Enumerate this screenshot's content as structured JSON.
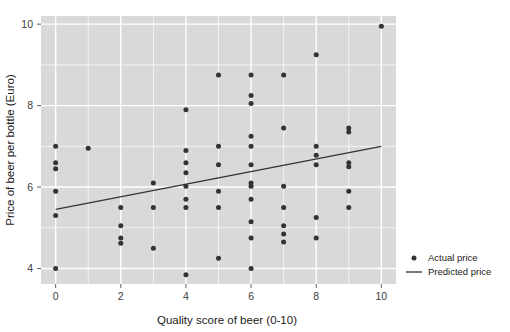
{
  "chart_data": {
    "type": "scatter",
    "title": "",
    "xlabel": "Quality score of beer (0-10)",
    "ylabel": "Price of beer per bottle (Euro)",
    "xlim": [
      -0.45,
      10.45
    ],
    "ylim": [
      3.62,
      10.2
    ],
    "xticks": [
      0,
      2,
      4,
      6,
      8,
      10
    ],
    "xtick_labels": [
      "0",
      "2",
      "4",
      "6",
      "8",
      "10"
    ],
    "yticks": [
      4,
      6,
      8,
      10
    ],
    "ytick_labels": [
      "4",
      "6",
      "8",
      "10"
    ],
    "grid": true,
    "grid_color": "#ffffff",
    "panel_background": "#d9d9d9",
    "point_color": "#333333",
    "line_color": "#333333",
    "legend_position": "right",
    "series": [
      {
        "name": "Actual price",
        "type": "scatter",
        "marker": "circle",
        "points": [
          [
            0,
            7.0
          ],
          [
            0,
            6.6
          ],
          [
            0,
            6.45
          ],
          [
            0,
            5.9
          ],
          [
            0,
            5.3
          ],
          [
            0,
            4.0
          ],
          [
            1,
            6.95
          ],
          [
            2,
            5.5
          ],
          [
            2,
            5.05
          ],
          [
            2,
            4.75
          ],
          [
            2,
            4.62
          ],
          [
            3,
            6.1
          ],
          [
            3,
            5.5
          ],
          [
            3,
            4.5
          ],
          [
            4,
            7.9
          ],
          [
            4,
            6.9
          ],
          [
            4,
            6.6
          ],
          [
            4,
            6.35
          ],
          [
            4,
            6.02
          ],
          [
            4,
            5.7
          ],
          [
            4,
            5.5
          ],
          [
            4,
            3.85
          ],
          [
            5,
            8.75
          ],
          [
            5,
            7.0
          ],
          [
            5,
            6.55
          ],
          [
            5,
            5.9
          ],
          [
            5,
            5.5
          ],
          [
            5,
            4.25
          ],
          [
            6,
            8.75
          ],
          [
            6,
            8.25
          ],
          [
            6,
            8.05
          ],
          [
            6,
            7.25
          ],
          [
            6,
            7.0
          ],
          [
            6,
            6.55
          ],
          [
            6,
            6.1
          ],
          [
            6,
            6.02
          ],
          [
            6,
            5.7
          ],
          [
            6,
            5.15
          ],
          [
            6,
            4.75
          ],
          [
            6,
            4.0
          ],
          [
            7,
            8.75
          ],
          [
            7,
            7.45
          ],
          [
            7,
            6.02
          ],
          [
            7,
            5.5
          ],
          [
            7,
            5.05
          ],
          [
            7,
            4.85
          ],
          [
            7,
            4.65
          ],
          [
            8,
            9.25
          ],
          [
            8,
            7.0
          ],
          [
            8,
            6.78
          ],
          [
            8,
            6.55
          ],
          [
            8,
            5.25
          ],
          [
            8,
            4.75
          ],
          [
            9,
            7.45
          ],
          [
            9,
            7.35
          ],
          [
            9,
            6.6
          ],
          [
            9,
            6.5
          ],
          [
            9,
            5.9
          ],
          [
            9,
            5.5
          ],
          [
            10,
            9.95
          ]
        ]
      },
      {
        "name": "Predicted price",
        "type": "line",
        "x": [
          0,
          10
        ],
        "y": [
          5.45,
          7.0
        ]
      }
    ],
    "legend": [
      {
        "label": "Actual price",
        "marker": "circle",
        "color": "#333333"
      },
      {
        "label": "Predicted price",
        "marker": "line",
        "color": "#333333"
      }
    ]
  }
}
